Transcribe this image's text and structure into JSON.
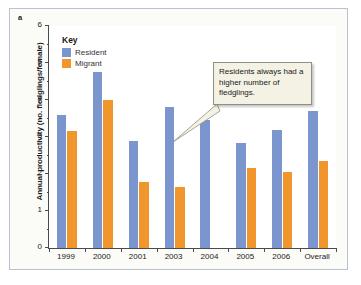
{
  "figure": {
    "panel_label": "a"
  },
  "legend": {
    "title": "Key",
    "items": [
      {
        "label": "Resident",
        "color": "#7b96ce"
      },
      {
        "label": "Migrant",
        "color": "#f0962d"
      }
    ]
  },
  "annotation": {
    "text": "Residents always had a higher number of fledglings."
  },
  "chart_data": {
    "type": "bar",
    "title": "",
    "xlabel": "",
    "ylabel": "Annual productivity (no. fledglings/female)",
    "ylim": [
      0,
      6
    ],
    "ytick_labels": [
      "0",
      "1",
      "2",
      "3",
      "4",
      "5",
      "6"
    ],
    "yticks": [
      0,
      1,
      2,
      3,
      4,
      5,
      6
    ],
    "yticks_minor": [
      0.5,
      1.5,
      2.5,
      3.5,
      4.5,
      5.5
    ],
    "grid": false,
    "legend_position": "top-left-inside",
    "categories": [
      "1999",
      "2000",
      "2001",
      "2003",
      "2004",
      "2005",
      "2006",
      "Overall"
    ],
    "series": [
      {
        "name": "Resident",
        "color": "#7b96ce",
        "values": [
          3.6,
          4.75,
          2.9,
          3.8,
          3.45,
          2.85,
          3.2,
          3.7
        ]
      },
      {
        "name": "Migrant",
        "color": "#f0962d",
        "values": [
          3.15,
          4.0,
          1.78,
          1.65,
          null,
          2.15,
          2.05,
          2.35
        ]
      }
    ]
  }
}
